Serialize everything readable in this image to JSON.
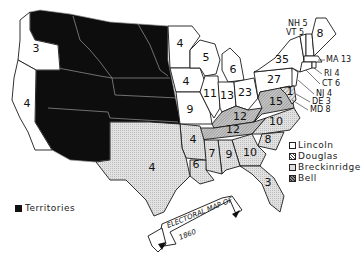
{
  "title": "Electoral Map of 1860",
  "banner": {
    "line1": "ELECTORAL MAP OF",
    "line2": "1860"
  },
  "legend": {
    "items": [
      {
        "label": "Lincoln",
        "pattern": "white"
      },
      {
        "label": "Douglas",
        "pattern": "hatched"
      },
      {
        "label": "Breckinridge",
        "pattern": "dotted-gray"
      },
      {
        "label": "Bell",
        "pattern": "dense-hatched"
      }
    ],
    "territories_label": "Territories"
  },
  "colors": {
    "territory": "#0d0d0d",
    "lincoln": "#ffffff",
    "breckinridge": "#dcdcdc",
    "outline": "#1a1a1a"
  },
  "states": {
    "oregon": "3",
    "california": "4",
    "minnesota": "4",
    "iowa": "4",
    "missouri": "9",
    "wisconsin": "5",
    "michigan": "6",
    "illinois": "11",
    "indiana": "13",
    "ohio": "23",
    "pennsylvania": "27",
    "new_york": "35",
    "maine": "8",
    "kentucky": "12",
    "virginia": "15",
    "tennessee": "12",
    "north_carolina": "10",
    "south_carolina": "8",
    "georgia": "10",
    "alabama": "9",
    "mississippi": "7",
    "louisiana": "6",
    "arkansas": "4",
    "texas": "4",
    "florida": "3",
    "delaware_region": "1"
  },
  "northeast_labels": {
    "nh": "NH 5",
    "vt": "VT 5",
    "ma": "MA 13",
    "ri": "RI 4",
    "ct": "CT 6",
    "nj": "NJ 4",
    "de": "DE 3",
    "md": "MD 8"
  }
}
